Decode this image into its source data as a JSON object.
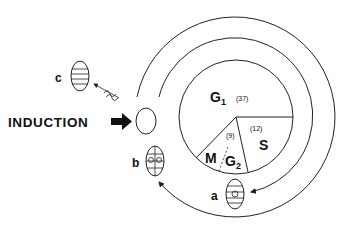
{
  "diagram": {
    "type": "cell-cycle",
    "induction_label": "INDUCTION",
    "phases": [
      {
        "name": "G",
        "sub": "1",
        "duration": "(37)"
      },
      {
        "name": "S",
        "sub": "",
        "duration": "(12)"
      },
      {
        "name": "G",
        "sub": "2",
        "duration": "(9)"
      },
      {
        "name": "M",
        "sub": "",
        "duration": ""
      }
    ],
    "cells": [
      {
        "label": "a"
      },
      {
        "label": "b"
      },
      {
        "label": "c"
      }
    ],
    "colors": {
      "stroke": "#222222",
      "background": "#ffffff"
    }
  }
}
